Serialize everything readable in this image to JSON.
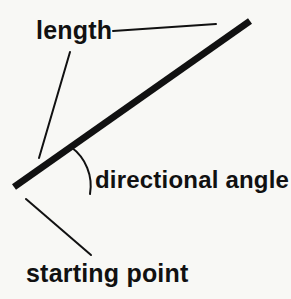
{
  "figure": {
    "background_color": "#f8f8f5",
    "ink_color": "#111111",
    "width": 291,
    "height": 299
  },
  "labels": {
    "length": "length",
    "directional_angle": "directional angle",
    "starting_point": "starting point"
  },
  "geometry": {
    "vector": {
      "name": "main-vector",
      "x1": 14,
      "y1": 187,
      "x2": 250,
      "y2": 21,
      "stroke_width": 7,
      "color": "#111111"
    },
    "angle_arc": {
      "name": "angle-arc",
      "start_x": 71,
      "start_y": 147,
      "end_x": 90,
      "end_y": 194,
      "radius": 48,
      "stroke_width": 2,
      "color": "#111111"
    },
    "leader_length_horizontal": {
      "name": "length-leader-horizontal",
      "x1": 113,
      "y1": 31,
      "x2": 216,
      "y2": 24,
      "stroke_width": 2,
      "color": "#111111"
    },
    "leader_length_diagonal": {
      "name": "length-leader-diagonal",
      "x1": 70,
      "y1": 52,
      "x2": 39,
      "y2": 158,
      "stroke_width": 2,
      "color": "#111111"
    },
    "leader_starting_point": {
      "name": "starting-point-leader",
      "x1": 26,
      "y1": 199,
      "x2": 91,
      "y2": 255,
      "stroke_width": 2,
      "color": "#111111"
    }
  }
}
